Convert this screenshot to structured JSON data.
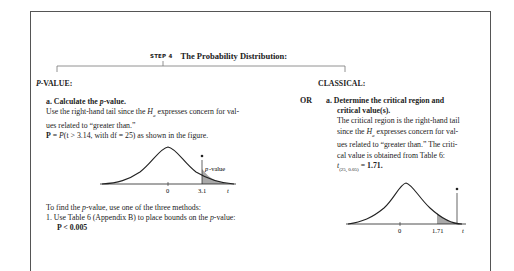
{
  "step": {
    "label": "STEP 4",
    "title": "The Probability Distribution:"
  },
  "pvalue": {
    "heading": "P-VALUE:",
    "heading_italic": "P",
    "heading_rest": "-VALUE:",
    "part_a": {
      "label": "a.",
      "title_pre": "Calculate the ",
      "title_ital": "p",
      "title_post": "-value.",
      "line1_pre": "Use the right-hand tail since the ",
      "line1_h": "H",
      "line1_sub": "a",
      "line1_post": " expresses concern for val-",
      "line2": "ues related to “greater than.”",
      "line3_bold": "P",
      "line3_eq": " = ",
      "line3_ital": "P",
      "line3_rest": "(t > 3.14, with df = 25) as shown in the figure."
    },
    "figure": {
      "type": "t-distribution",
      "tail": "right",
      "tick_center": "0",
      "tick_value": "3.1",
      "axis_label": "t",
      "annotation": "p-value",
      "shade_color": "#a9a9a9"
    },
    "methods": {
      "intro_pre": "To find the ",
      "intro_ital": "p",
      "intro_post": "-value, use one of the three methods:",
      "item1_num": "1.",
      "item1_pre": "Use Table 6 (Appendix B) to place bounds on the ",
      "item1_ital": "p",
      "item1_post": "-value:",
      "item1_result": "P < 0.005"
    }
  },
  "classical": {
    "heading": "CLASSICAL:",
    "or_label": "OR",
    "part_a": {
      "label": "a.",
      "title_line1": "Determine the critical region and",
      "title_line2": "critical value(s).",
      "body1": "The critical region is the right-hand tail",
      "body2_pre": "since the ",
      "body2_h": "H",
      "body2_sub": "a",
      "body2_post": " expresses concern for val-",
      "body3": "ues related to “greater than.” The criti-",
      "body4": "cal value is obtained from Table 6:",
      "crit_t": "t",
      "crit_sub": "(25, 0.05)",
      "crit_eq": " = ",
      "crit_val": "1.71."
    },
    "figure": {
      "type": "t-distribution",
      "tail": "right",
      "tick_center": "0",
      "tick_value": "1.71",
      "axis_label": "t",
      "shade_color": "#a9a9a9"
    }
  }
}
